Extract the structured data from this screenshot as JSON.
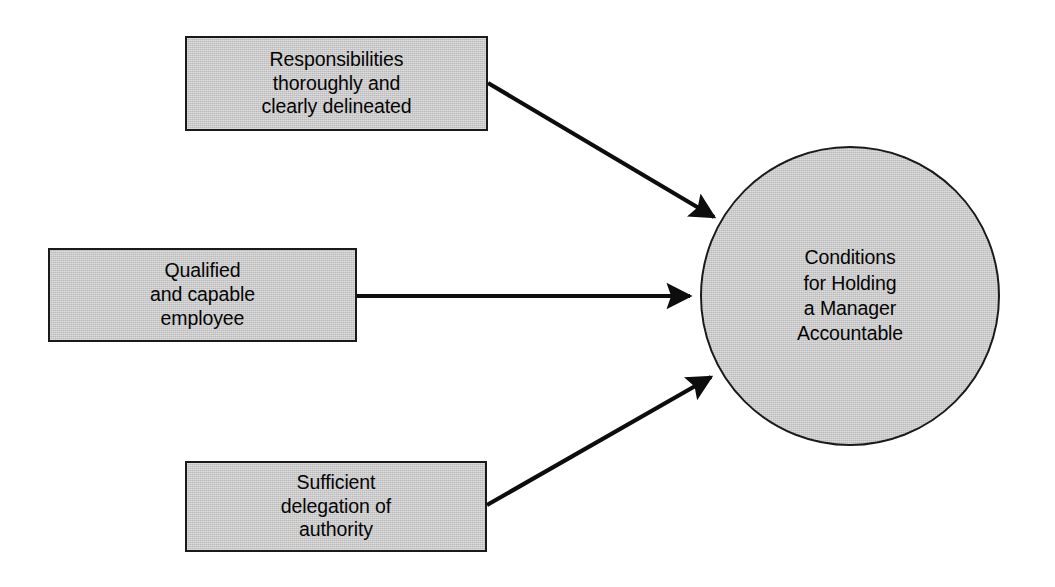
{
  "diagram": {
    "title": "Conditions for Holding a Manager Accountable",
    "background_color": "#ffffff",
    "shape_fill_color": "#c6c6c6",
    "shape_stroke_color": "#1a1a1a",
    "text_color": "#050505",
    "nodes": [
      {
        "id": "responsibilities",
        "shape": "rectangle",
        "label": "Responsibilities\nthoroughly and\nclearly delineated"
      },
      {
        "id": "qualified",
        "shape": "rectangle",
        "label": "Qualified\nand capable\nemployee"
      },
      {
        "id": "delegation",
        "shape": "rectangle",
        "label": "Sufficient\ndelegation of\nauthority"
      },
      {
        "id": "outcome",
        "shape": "circle",
        "label": "Conditions\nfor Holding\na Manager\nAccountable"
      }
    ],
    "edges": [
      {
        "id": "edge-responsibilities-outcome",
        "from": "responsibilities",
        "to": "outcome",
        "style": "solid-arrow"
      },
      {
        "id": "edge-qualified-outcome",
        "from": "qualified",
        "to": "outcome",
        "style": "solid-arrow"
      },
      {
        "id": "edge-delegation-outcome",
        "from": "delegation",
        "to": "outcome",
        "style": "solid-arrow"
      }
    ]
  }
}
